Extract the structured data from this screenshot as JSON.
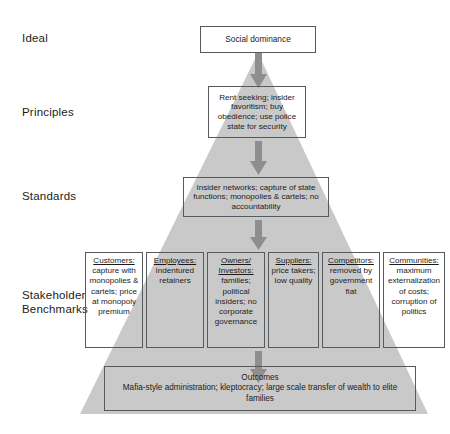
{
  "diagram": {
    "colors": {
      "pyramid_fill": "#c9c9c9",
      "box_border": "#555a5f",
      "arrow_fill": "#8e8e8e",
      "text": "#1b1b1b",
      "background": "#ffffff"
    },
    "row_labels": [
      {
        "id": "ideal",
        "text": "Ideal"
      },
      {
        "id": "principles",
        "text": "Principles"
      },
      {
        "id": "standards",
        "text": "Standards"
      },
      {
        "id": "stakeholder",
        "text": "Stakeholder\nBenchmarks"
      }
    ],
    "boxes": {
      "ideal": {
        "text": "Social dominance"
      },
      "principles": {
        "text": "Rent seeking; insider favoritism; buy obedience; use police state for security"
      },
      "standards": {
        "text": "Insider networks; capture of state functions; monopolies & cartels; no accountability"
      },
      "outcomes": {
        "heading": "Outcomes",
        "text": "Mafia-style administration; kleptocracy; large scale transfer of wealth to elite families"
      }
    },
    "stakeholders": [
      {
        "title": "Customers:",
        "body": "capture with monopolies & cartels; price at monopoly premium"
      },
      {
        "title": "Employees:",
        "body": "indentured retainers"
      },
      {
        "title": "Owners/ Investors:",
        "body": "families; political insiders; no corporate governance"
      },
      {
        "title": "Suppliers:",
        "body": "price takers; low quality"
      },
      {
        "title": "Competitors:",
        "body": "removed by government fiat"
      },
      {
        "title": "Communities:",
        "body": "maximum externalization of costs; corruption of politics"
      }
    ],
    "arrows": [
      {
        "id": "ideal-to-principles",
        "direction": "down"
      },
      {
        "id": "principles-to-standards",
        "direction": "down"
      },
      {
        "id": "standards-to-stakeholder",
        "direction": "down"
      },
      {
        "id": "stakeholder-to-outcomes",
        "direction": "down"
      }
    ]
  }
}
